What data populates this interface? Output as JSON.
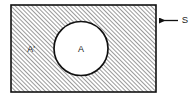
{
  "figure": {
    "type": "venn-diagram",
    "labels": {
      "universal_set": "S",
      "set": "A",
      "complement": "A'"
    },
    "colors": {
      "stroke": "#111111",
      "hatch": "#6e6e6e",
      "fill_inner": "#ffffff",
      "background": "#ffffff"
    },
    "geometry": {
      "rect": {
        "x": 11,
        "y": 5,
        "width": 145,
        "height": 87
      },
      "circle": {
        "cx": 81,
        "cy": 48.5,
        "r": 27
      },
      "arrow": {
        "tip_x": 157,
        "tail_x": 178,
        "y": 20.5
      },
      "label_positions": {
        "complement": {
          "x": 31,
          "y": 50
        },
        "set": {
          "x": 81,
          "y": 50
        },
        "universal_set": {
          "x": 185,
          "y": 20.5
        }
      },
      "hatch_spacing": 3,
      "hatch_angle": 45
    }
  }
}
